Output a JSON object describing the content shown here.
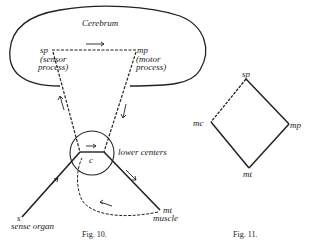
{
  "fig10": {
    "title": "Cerebrum",
    "sp": "sp",
    "sp_desc1": "(sensor",
    "sp_desc2": "process)",
    "mp": "mp",
    "mp_desc1": "(motor",
    "mp_desc2": "process)",
    "c": "c",
    "lower_centers": "lower centers",
    "s": "s",
    "sense_organ": "sense organ",
    "mt": "mt",
    "muscle": "muscle",
    "caption": "Fig. 10."
  },
  "fig11": {
    "sp": "sp",
    "mc": "mc",
    "mp": "mp",
    "mt": "mt",
    "caption": "Fig. 11."
  }
}
